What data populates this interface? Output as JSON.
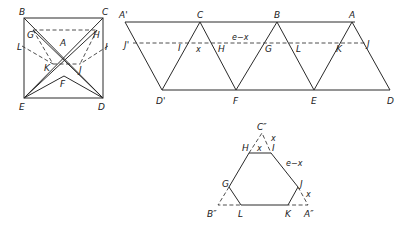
{
  "figure": {
    "square_diagram": {
      "vertices": {
        "B": "B",
        "C": "C",
        "E": "E",
        "D": "D"
      },
      "inner_points": {
        "A": "A",
        "F": "F",
        "G": "G",
        "H": "H",
        "I": "I",
        "J": "J",
        "K": "K",
        "L": "L"
      }
    },
    "strip_diagram": {
      "top_labels": [
        "A'",
        "C",
        "B",
        "A"
      ],
      "bottom_labels": [
        "D'",
        "F",
        "E",
        "D"
      ],
      "dashed_labels": [
        "J'",
        "I",
        "H",
        "G",
        "L",
        "K",
        "J"
      ],
      "segment_labels": {
        "x": "x",
        "e_minus_x": "e−x"
      }
    },
    "hexagon_diagram": {
      "apex_labels": {
        "C2": "C″",
        "B2": "B″",
        "A2": "A″"
      },
      "vertex_labels": {
        "H": "H",
        "I": "I",
        "G": "G",
        "J": "J",
        "L": "L",
        "K": "K"
      },
      "side_labels": {
        "top": "x",
        "upper_right_corner": "x",
        "right_side": "e−x",
        "lower_right_corner": "x"
      }
    }
  }
}
